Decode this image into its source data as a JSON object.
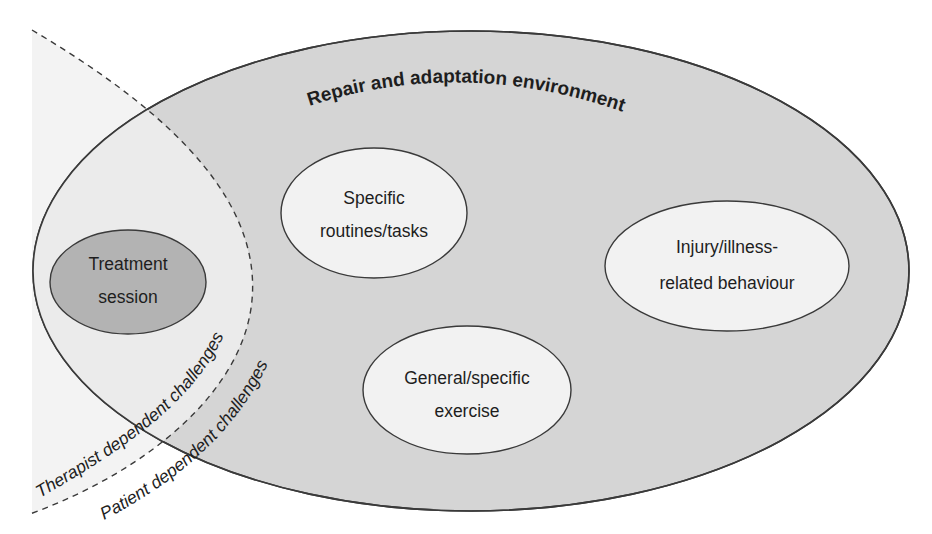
{
  "diagram": {
    "title": "Repair and adaptation environment",
    "colors": {
      "background": "#ffffff",
      "environment_fill": "#d5d5d5",
      "therapist_zone_fill": "#ededed",
      "node_fill": "#f2f2f2",
      "treatment_fill": "#b3b3b3",
      "stroke": "#3a3a3a",
      "text": "#1e1e1e"
    },
    "nodes": [
      {
        "id": "treatment-session",
        "lines": [
          "Treatment",
          "session"
        ],
        "shaded": true
      },
      {
        "id": "specific-routines",
        "lines": [
          "Specific",
          "routines/tasks"
        ],
        "shaded": false
      },
      {
        "id": "injury-behaviour",
        "lines": [
          "Injury/illness-",
          "related behaviour"
        ],
        "shaded": false
      },
      {
        "id": "general-exercise",
        "lines": [
          "General/specific",
          "exercise"
        ],
        "shaded": false
      }
    ],
    "boundaries": [
      {
        "id": "therapist-boundary",
        "label": "Therapist dependent challenges",
        "style": "dashed"
      },
      {
        "id": "patient-boundary",
        "label": "Patient dependent challenges",
        "style": "none"
      }
    ]
  }
}
